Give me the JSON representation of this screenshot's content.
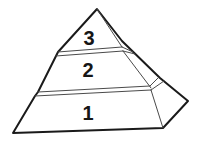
{
  "diagram": {
    "type": "pyramid",
    "levels": [
      {
        "label": "3",
        "position": "top"
      },
      {
        "label": "2",
        "position": "middle"
      },
      {
        "label": "1",
        "position": "bottom"
      }
    ],
    "colors": {
      "outline": "#1a1a1a",
      "inner_line": "#4a4a4a",
      "face": "#ffffff",
      "background": "#ffffff",
      "label_text": "#161616"
    }
  }
}
